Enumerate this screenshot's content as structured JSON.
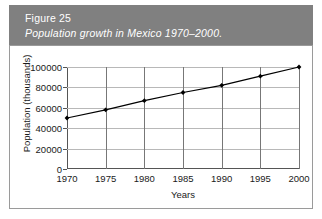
{
  "caption": {
    "figure_number": "Figure 25",
    "title": "Population growth in Mexico 1970–2000.",
    "band_color": "#808080",
    "text_color": "#ffffff"
  },
  "chart_data": {
    "type": "line",
    "title": "Population growth in Mexico 1970–2000.",
    "xlabel": "Years",
    "ylabel": "Population (thousands)",
    "categories": [
      "1970",
      "1975",
      "1980",
      "1985",
      "1990",
      "1995",
      "2000"
    ],
    "x": [
      1970,
      1975,
      1980,
      1985,
      1990,
      1995,
      2000
    ],
    "values": [
      50000,
      58000,
      67000,
      75000,
      82000,
      91000,
      100000
    ],
    "series": [
      {
        "name": "Population",
        "values": [
          50000,
          58000,
          67000,
          75000,
          82000,
          91000,
          100000
        ]
      }
    ],
    "xlim": [
      1970,
      2000
    ],
    "ylim": [
      0,
      100000
    ],
    "ytick_labels": [
      "0",
      "20000",
      "40000",
      "60000",
      "80000",
      "100000"
    ],
    "yticks": [
      0,
      20000,
      40000,
      60000,
      80000,
      100000
    ],
    "xtick_labels": [
      "1970",
      "1975",
      "1980",
      "1985",
      "1990",
      "1995",
      "2000"
    ],
    "grid": "both",
    "legend": "none",
    "line_color": "#000000",
    "marker": "diamond",
    "marker_color": "#000000",
    "gridline_color": "#b8b8b8",
    "axis_color": "#555555"
  }
}
